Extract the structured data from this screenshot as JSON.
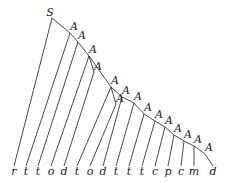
{
  "diagram": {
    "type": "parse-tree",
    "root_label": "S",
    "node_label": "A",
    "root": {
      "x": 52,
      "y": 18
    },
    "spine": [
      {
        "x": 70,
        "y": 33
      },
      {
        "x": 78,
        "y": 42
      },
      {
        "x": 89,
        "y": 56
      },
      {
        "x": 111,
        "y": 87
      },
      {
        "x": 122,
        "y": 97
      },
      {
        "x": 134,
        "y": 103
      },
      {
        "x": 144,
        "y": 114
      },
      {
        "x": 155,
        "y": 121
      },
      {
        "x": 165,
        "y": 127
      },
      {
        "x": 174,
        "y": 135
      },
      {
        "x": 184,
        "y": 141
      },
      {
        "x": 194,
        "y": 146
      },
      {
        "x": 205,
        "y": 154
      }
    ],
    "branches": [
      {
        "from": 2,
        "x": 94,
        "y": 72
      },
      {
        "from": 3,
        "x": 116,
        "y": 104
      }
    ],
    "leaves": [
      "r",
      "t",
      "t",
      "o",
      "d",
      "t",
      "o",
      "d",
      "t",
      "t",
      "t",
      "c",
      "p",
      "c",
      "m",
      "d"
    ],
    "leaf_x": [
      14,
      26,
      38,
      51,
      64,
      77,
      90,
      103,
      116,
      129,
      142,
      155,
      168,
      181,
      194,
      213
    ],
    "leaf_y": 175
  }
}
